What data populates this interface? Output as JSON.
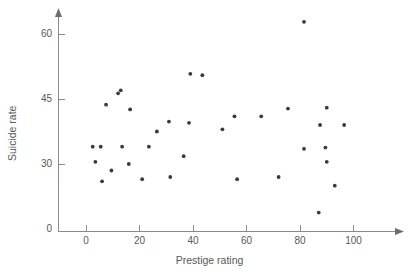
{
  "chart_data": {
    "type": "scatter",
    "title": "",
    "xlabel": "Prestige rating",
    "ylabel": "Suicide rate",
    "xlim": [
      -10,
      112
    ],
    "ylim": [
      0,
      66
    ],
    "grid": false,
    "legend": "none",
    "y_axis_broken": true,
    "x_ticks": [
      0,
      20,
      40,
      60,
      80,
      100
    ],
    "x_tick_labels": [
      "0",
      "20",
      "40",
      "60",
      "80",
      "100"
    ],
    "y_ticks": [
      0,
      30,
      45,
      60
    ],
    "y_tick_labels": [
      "0",
      "30",
      "45",
      "60"
    ],
    "marker": "filled-circle",
    "marker_color": "#3a3a3c",
    "axis_color": "#8a8a8c",
    "text_color": "#58585a",
    "background_color": "#ffffff",
    "n_points": 41,
    "points": [
      {
        "x": 2.5,
        "y": 34
      },
      {
        "x": 3.5,
        "y": 30.5
      },
      {
        "x": 5.5,
        "y": 34
      },
      {
        "x": 6,
        "y": 26
      },
      {
        "x": 7.5,
        "y": 43.7
      },
      {
        "x": 9.5,
        "y": 28.5
      },
      {
        "x": 12,
        "y": 46.3
      },
      {
        "x": 13,
        "y": 47
      },
      {
        "x": 13.5,
        "y": 34
      },
      {
        "x": 16,
        "y": 30
      },
      {
        "x": 16.5,
        "y": 42.6
      },
      {
        "x": 21,
        "y": 26.5
      },
      {
        "x": 23.5,
        "y": 34
      },
      {
        "x": 26.5,
        "y": 37.5
      },
      {
        "x": 31,
        "y": 39.8
      },
      {
        "x": 31.5,
        "y": 27
      },
      {
        "x": 36.5,
        "y": 31.8
      },
      {
        "x": 38.5,
        "y": 39.5
      },
      {
        "x": 39,
        "y": 50.8
      },
      {
        "x": 43.5,
        "y": 50.5
      },
      {
        "x": 51,
        "y": 38
      },
      {
        "x": 55.5,
        "y": 41
      },
      {
        "x": 56.5,
        "y": 26.5
      },
      {
        "x": 65.5,
        "y": 41
      },
      {
        "x": 72,
        "y": 27
      },
      {
        "x": 75.5,
        "y": 42.8
      },
      {
        "x": 81.5,
        "y": 62.8
      },
      {
        "x": 81.5,
        "y": 33.5
      },
      {
        "x": 87,
        "y": 18.8
      },
      {
        "x": 87.5,
        "y": 39
      },
      {
        "x": 89.5,
        "y": 33.8
      },
      {
        "x": 90,
        "y": 43
      },
      {
        "x": 90,
        "y": 30.5
      },
      {
        "x": 93,
        "y": 25
      },
      {
        "x": 96.5,
        "y": 39
      }
    ]
  },
  "figure": {
    "name": "suicide-rate-vs-prestige-scatter"
  }
}
